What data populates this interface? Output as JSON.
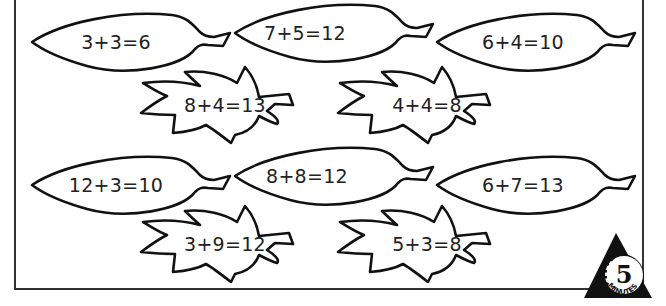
{
  "worksheet": {
    "leaves": [
      {
        "id": "leaf-1",
        "shape": "long",
        "equation": "3+3=6"
      },
      {
        "id": "leaf-2",
        "shape": "long",
        "equation": "7+5=12"
      },
      {
        "id": "leaf-3",
        "shape": "long",
        "equation": "6+4=10"
      },
      {
        "id": "leaf-4",
        "shape": "maple",
        "equation": "8+4=13"
      },
      {
        "id": "leaf-5",
        "shape": "maple",
        "equation": "4+4=8"
      },
      {
        "id": "leaf-6",
        "shape": "long",
        "equation": "12+3=10"
      },
      {
        "id": "leaf-7",
        "shape": "long",
        "equation": "8+8=12"
      },
      {
        "id": "leaf-8",
        "shape": "long",
        "equation": "6+7=13"
      },
      {
        "id": "leaf-9",
        "shape": "maple",
        "equation": "3+9=12"
      },
      {
        "id": "leaf-10",
        "shape": "maple",
        "equation": "5+3=8"
      }
    ],
    "timer_badge": {
      "number": "5",
      "label": "MINUTES"
    }
  },
  "colors": {
    "ink": "#111111",
    "background": "#ffffff",
    "frame": "#333333"
  }
}
